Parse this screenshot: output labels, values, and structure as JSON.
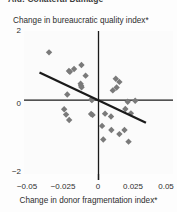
{
  "figure": {
    "title": "Aid: Collateral Damage",
    "title_clipped": true
  },
  "chart_data": {
    "type": "scatter",
    "title": "Aid: Collateral Damage",
    "xlabel": "Change in donor fragmentation index*",
    "ylabel": "Change in bureaucratic quality index*",
    "xlim": [
      -0.0625,
      0.0625
    ],
    "ylim": [
      -2.35,
      2.2
    ],
    "xticks": [
      -0.05,
      -0.025,
      0,
      0.025,
      0.05
    ],
    "xtick_labels": [
      "−0.05",
      "−0.025",
      "0",
      "0.025",
      "0.05"
    ],
    "yticks": [
      2,
      0,
      -2
    ],
    "ytick_labels": [
      "2",
      "0",
      "−2"
    ],
    "grid": false,
    "legend": null,
    "marker": {
      "shape": "diamond",
      "color": "#7a7a7a",
      "size": 3.2
    },
    "axes_lines": {
      "x_axis_at_y": 0,
      "y_axis_at_x": 0,
      "color": "#1a1a1a"
    },
    "points": [
      {
        "x": -0.0415,
        "y": 1.52
      },
      {
        "x": -0.0205,
        "y": 0.99
      },
      {
        "x": -0.0143,
        "y": 1.12
      },
      {
        "x": -0.0108,
        "y": 0.78
      },
      {
        "x": -0.0248,
        "y": 0.93
      },
      {
        "x": -0.024,
        "y": 0.9
      },
      {
        "x": -0.015,
        "y": 0.52
      },
      {
        "x": -0.0146,
        "y": 0.46
      },
      {
        "x": -0.0142,
        "y": 0.41
      },
      {
        "x": -0.0262,
        "y": 0.18
      },
      {
        "x": -0.006,
        "y": 0.02
      },
      {
        "x": -0.0055,
        "y": 0.0
      },
      {
        "x": -0.0288,
        "y": -0.29
      },
      {
        "x": -0.0272,
        "y": -0.46
      },
      {
        "x": -0.0246,
        "y": -0.63
      },
      {
        "x": -0.0062,
        "y": -0.44
      },
      {
        "x": -0.005,
        "y": -0.47
      },
      {
        "x": 0.0055,
        "y": -0.43
      },
      {
        "x": 0.0105,
        "y": -0.52
      },
      {
        "x": 0.003,
        "y": -0.82
      },
      {
        "x": 0.0108,
        "y": -0.95
      },
      {
        "x": 0.0145,
        "y": 0.68
      },
      {
        "x": 0.0175,
        "y": 0.58
      },
      {
        "x": 0.012,
        "y": 0.31
      },
      {
        "x": 0.0152,
        "y": 0.4
      },
      {
        "x": 0.0245,
        "y": -0.05
      },
      {
        "x": 0.0308,
        "y": -0.02
      },
      {
        "x": 0.0225,
        "y": -0.28
      },
      {
        "x": 0.0272,
        "y": -0.42
      },
      {
        "x": 0.004,
        "y": -1.25
      },
      {
        "x": 0.0175,
        "y": -1.08
      },
      {
        "x": 0.0218,
        "y": -0.95
      },
      {
        "x": 0.0252,
        "y": -1.32
      }
    ],
    "trend_line": {
      "x1": -0.0495,
      "y1": 0.88,
      "x2": 0.0398,
      "y2": -0.72,
      "color": "#1a1a1a",
      "width": 2.2
    }
  }
}
